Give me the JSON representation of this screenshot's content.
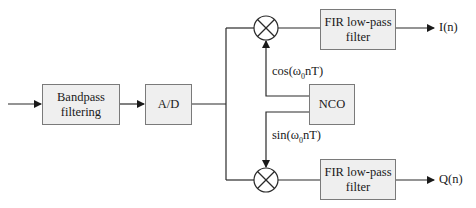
{
  "diagram": {
    "type": "block-diagram",
    "blocks": {
      "bandpass": {
        "line1": "Bandpass",
        "line2": "filtering"
      },
      "adc": {
        "label": "A/D"
      },
      "nco": {
        "label": "NCO"
      },
      "fir_top": {
        "line1": "FIR low-pass",
        "line2": "filter"
      },
      "fir_bottom": {
        "line1": "FIR low-pass",
        "line2": "filter"
      }
    },
    "mixers": [
      {
        "id": "mixer-top",
        "symbol": "multiply"
      },
      {
        "id": "mixer-bottom",
        "symbol": "multiply"
      }
    ],
    "signals": {
      "cos": {
        "pre": "cos(ω",
        "sub": "0",
        "post": "nT)"
      },
      "sin": {
        "pre": "sin(ω",
        "sub": "0",
        "post": "nT)"
      },
      "out_i": "I(n)",
      "out_q": "Q(n)"
    },
    "colors": {
      "line": "#2a2a2a",
      "box_fill": "#efefef",
      "box_border": "#7a7a7a"
    }
  }
}
